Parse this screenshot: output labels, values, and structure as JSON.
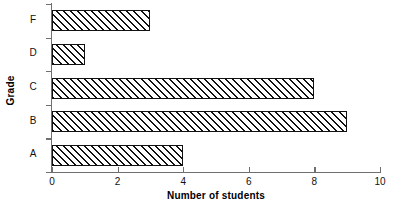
{
  "chart_data": {
    "type": "bar",
    "orientation": "horizontal",
    "title": "",
    "xlabel": "Number of students",
    "ylabel": "Grade",
    "categories": [
      "F",
      "D",
      "C",
      "B",
      "A"
    ],
    "values": [
      3,
      1,
      8,
      9,
      4
    ],
    "series": [
      {
        "name": "Number of students",
        "values": [
          3,
          1,
          8,
          9,
          4
        ]
      }
    ],
    "category_order_top_to_bottom": [
      "F",
      "D",
      "C",
      "B",
      "A"
    ],
    "xlim": [
      0,
      10
    ],
    "x_ticks": [
      0,
      2,
      4,
      6,
      8,
      10
    ],
    "x_tick_labels": [
      "0",
      "2",
      "4",
      "6",
      "8",
      "10"
    ],
    "grid": false,
    "legend": false,
    "bar_fill": "diagonal-hatch",
    "bar_edge_color": "#111111",
    "bar_face_color": "#ffffff",
    "axis_color": "#6f6f6f",
    "background_color": "#ffffff",
    "points": [
      {
        "category": "F",
        "value": 3
      },
      {
        "category": "D",
        "value": 1
      },
      {
        "category": "C",
        "value": 8
      },
      {
        "category": "B",
        "value": 9
      },
      {
        "category": "A",
        "value": 4
      }
    ]
  }
}
